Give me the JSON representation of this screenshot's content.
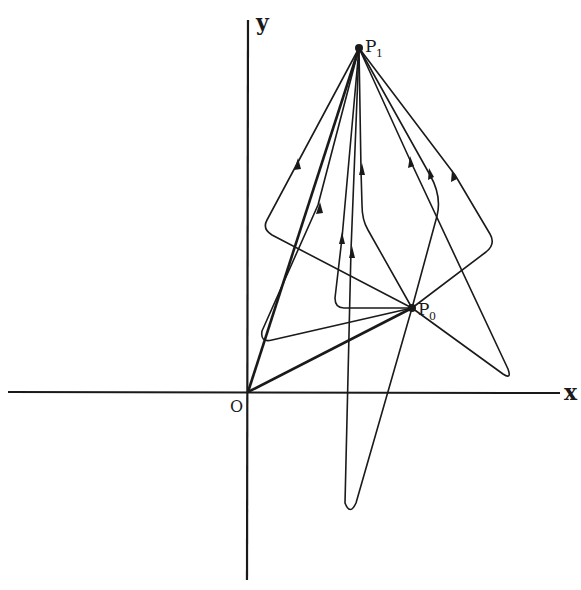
{
  "diagram": {
    "axes": {
      "x_label": "x",
      "y_label": "y",
      "origin_label": "O"
    },
    "points": {
      "p0": {
        "label": "P",
        "subscript": "0"
      },
      "p1": {
        "label": "P",
        "subscript": "1"
      }
    },
    "colors": {
      "ink": "#1a1a1a",
      "background": "#ffffff"
    }
  }
}
